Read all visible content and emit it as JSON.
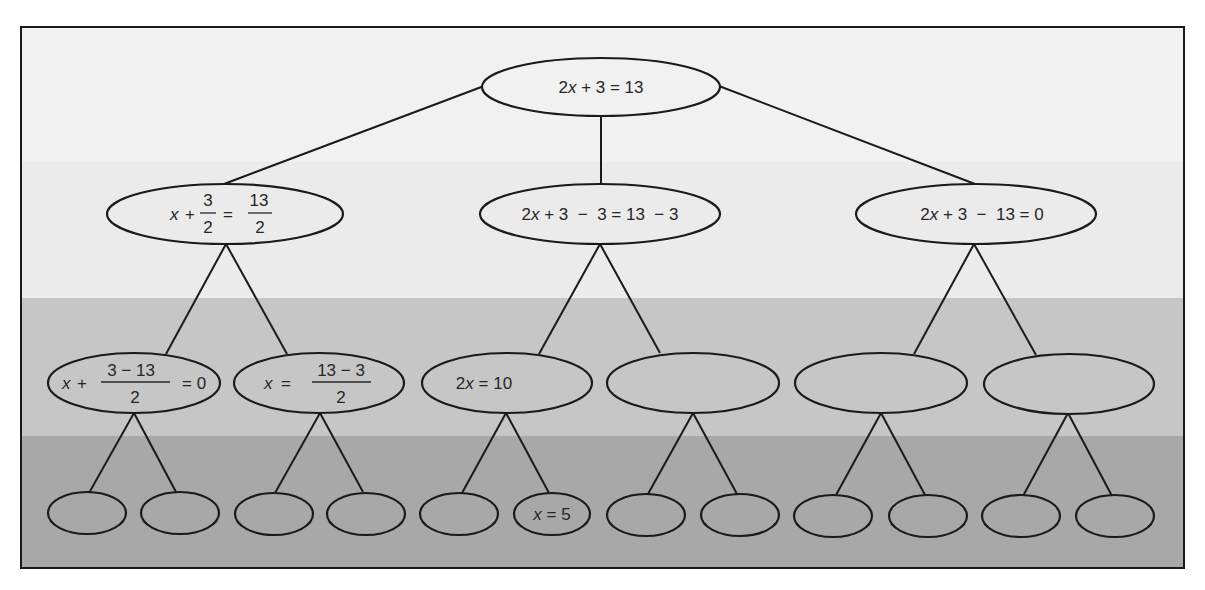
{
  "diagram": {
    "title": "",
    "type": "equation-solving tree",
    "colors": {
      "band_1": "#f1f1f1",
      "band_2": "#ebebeb",
      "band_3": "#c6c6c6",
      "band_4": "#a8a8a8",
      "line": "#1a1a1a",
      "text": "#262626"
    },
    "root": {
      "id": "n0",
      "label": "2x + 3 = 13",
      "parts": [
        "2",
        "x",
        " + 3 = 13"
      ]
    },
    "level1": [
      {
        "id": "n1",
        "label": "x + 3/2 = 13/2",
        "prefix": "x",
        "op": "+",
        "frac1_num": "3",
        "frac1_den": "2",
        "eq": "=",
        "frac2_num": "13",
        "frac2_den": "2"
      },
      {
        "id": "n2",
        "label": "2x + 3 − 3 = 13 − 3",
        "parts": [
          "2",
          "x",
          " + 3  −  3 = 13  − 3"
        ]
      },
      {
        "id": "n3",
        "label": "2x + 3 − 13 = 0",
        "parts": [
          "2",
          "x",
          " + 3  −  13 = 0"
        ]
      }
    ],
    "level2": [
      {
        "id": "n4",
        "label": "x + (3 − 13)/2 = 0",
        "prefix": "x",
        "op": "+",
        "frac_num": "3 − 13",
        "frac_den": "2",
        "suffix": "= 0"
      },
      {
        "id": "n5",
        "label": "x = (13 − 3)/2",
        "prefix": "x",
        "op": "=",
        "frac_num": "13 − 3",
        "frac_den": "2"
      },
      {
        "id": "n6",
        "label": "2x = 10",
        "parts": [
          "2",
          "x",
          " = 10"
        ]
      },
      {
        "id": "n7",
        "label": ""
      },
      {
        "id": "n8",
        "label": ""
      },
      {
        "id": "n9",
        "label": ""
      }
    ],
    "level3": [
      {
        "id": "n10",
        "label": ""
      },
      {
        "id": "n11",
        "label": ""
      },
      {
        "id": "n12",
        "label": ""
      },
      {
        "id": "n13",
        "label": ""
      },
      {
        "id": "n14",
        "label": ""
      },
      {
        "id": "n15",
        "label": "x = 5",
        "parts": [
          "x",
          " = 5"
        ]
      },
      {
        "id": "n16",
        "label": ""
      },
      {
        "id": "n17",
        "label": ""
      },
      {
        "id": "n18",
        "label": ""
      },
      {
        "id": "n19",
        "label": ""
      },
      {
        "id": "n20",
        "label": ""
      },
      {
        "id": "n21",
        "label": ""
      }
    ]
  }
}
